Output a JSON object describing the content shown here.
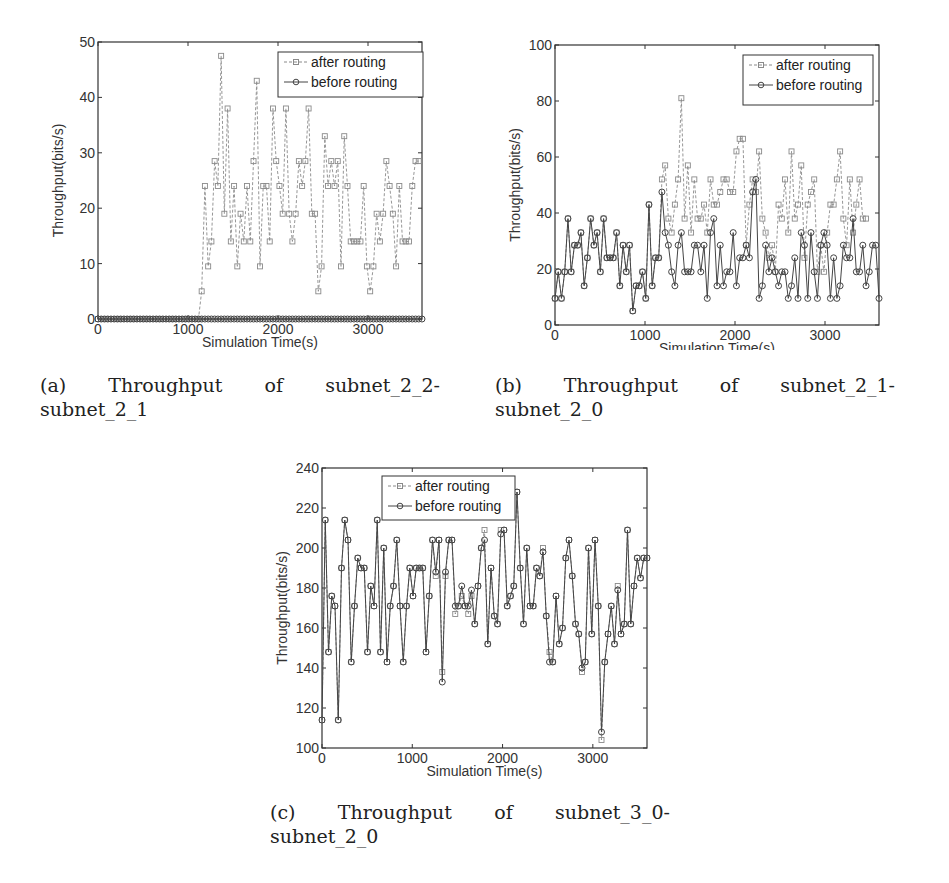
{
  "figures": [
    {
      "id": "a",
      "caption_line1": [
        "(a)",
        "Throughput",
        "of",
        "subnet_2_2-"
      ],
      "caption_line2": "subnet_2_1"
    },
    {
      "id": "b",
      "caption_line1": [
        "(b)",
        "Throughput",
        "of",
        "subnet_2_1-"
      ],
      "caption_line2": "subnet_2_0"
    },
    {
      "id": "c",
      "caption_line1": [
        "(c)",
        "Throughput",
        "of",
        "subnet_3_0-"
      ],
      "caption_line2": "subnet_2_0"
    }
  ],
  "chart_data": [
    {
      "type": "line",
      "title": "",
      "xlabel": "Simulation Time(s)",
      "ylabel": "Throughput(bits/s)",
      "xlim": [
        0,
        3600
      ],
      "ylim": [
        0,
        50
      ],
      "xticks": [
        0,
        1000,
        2000,
        3000
      ],
      "yticks": [
        0,
        10,
        20,
        30,
        40,
        50
      ],
      "grid": false,
      "legend_position": "upper right",
      "legend": [
        "after routing",
        "before routing"
      ],
      "x_step": 36,
      "series": [
        {
          "name": "after routing",
          "marker": "square",
          "values": [
            0,
            0,
            0,
            0,
            0,
            0,
            0,
            0,
            0,
            0,
            0,
            0,
            0,
            0,
            0,
            0,
            0,
            0,
            0,
            0,
            0,
            0,
            0,
            0,
            0,
            0,
            0,
            0,
            0,
            0,
            0,
            0,
            5,
            24,
            9.5,
            14,
            28.5,
            24,
            47.5,
            19,
            38,
            14,
            24,
            9.5,
            19,
            14,
            24,
            14,
            28.5,
            43,
            9.5,
            24,
            24,
            14,
            38,
            28.5,
            24,
            19,
            38,
            19,
            14,
            19,
            28.5,
            24,
            28.5,
            38,
            19,
            19,
            5,
            9.5,
            33,
            24,
            28.5,
            24,
            28.5,
            9.5,
            33,
            24,
            14,
            14,
            14,
            14,
            24,
            9.5,
            5,
            9.5,
            19,
            14,
            19,
            28.5,
            24,
            19,
            9.5,
            24,
            14,
            14,
            14,
            24,
            28.5,
            28.5
          ]
        },
        {
          "name": "before routing",
          "marker": "circle",
          "values": [
            0,
            0,
            0,
            0,
            0,
            0,
            0,
            0,
            0,
            0,
            0,
            0,
            0,
            0,
            0,
            0,
            0,
            0,
            0,
            0,
            0,
            0,
            0,
            0,
            0,
            0,
            0,
            0,
            0,
            0,
            0,
            0,
            0,
            0,
            0,
            0,
            0,
            0,
            0,
            0,
            0,
            0,
            0,
            0,
            0,
            0,
            0,
            0,
            0,
            0,
            0,
            0,
            0,
            0,
            0,
            0,
            0,
            0,
            0,
            0,
            0,
            0,
            0,
            0,
            0,
            0,
            0,
            0,
            0,
            0,
            0,
            0,
            0,
            0,
            0,
            0,
            0,
            0,
            0,
            0,
            0,
            0,
            0,
            0,
            0,
            0,
            0,
            0,
            0,
            0,
            0,
            0,
            0,
            0,
            0,
            0,
            0,
            0,
            0,
            0,
            0
          ]
        }
      ]
    },
    {
      "type": "line",
      "title": "",
      "xlabel": "Simulation Time(s)",
      "ylabel": "Throughput(bits/s)",
      "xlim": [
        0,
        3600
      ],
      "ylim": [
        0,
        100
      ],
      "xticks": [
        0,
        1000,
        2000,
        3000
      ],
      "yticks": [
        0,
        20,
        40,
        60,
        80,
        100
      ],
      "grid": false,
      "legend_position": "upper right",
      "legend": [
        "after  routing",
        "before routing"
      ],
      "x_step": 36,
      "series": [
        {
          "name": "after routing",
          "marker": "square",
          "values": [
            9.5,
            19,
            9.5,
            19,
            38,
            19,
            28.5,
            28.5,
            33,
            14,
            24,
            38,
            28.5,
            33,
            19,
            38,
            24,
            24,
            24,
            33,
            14,
            28.5,
            19,
            28.5,
            5,
            14,
            14,
            19,
            9.5,
            43,
            14,
            24,
            24,
            52,
            57,
            38,
            33,
            43,
            52,
            81,
            38,
            57,
            33,
            52,
            38,
            38,
            43,
            33,
            52,
            43,
            43,
            47.5,
            52,
            52,
            47.5,
            47.5,
            62,
            66.5,
            66.5,
            28.5,
            43,
            52,
            47.5,
            62,
            38,
            33,
            24,
            28.5,
            19,
            43,
            38,
            52,
            33,
            62,
            38,
            43,
            57,
            24,
            43,
            47.5,
            52,
            19,
            28.5,
            19,
            33,
            43,
            43,
            52,
            62,
            38,
            28.5,
            52,
            33,
            43,
            52,
            38,
            38
          ]
        },
        {
          "name": "before routing",
          "marker": "circle",
          "values": [
            9.5,
            19,
            9.5,
            19,
            38,
            19,
            28.5,
            28.5,
            33,
            14,
            24,
            38,
            28.5,
            33,
            19,
            38,
            24,
            24,
            24,
            33,
            14,
            28.5,
            19,
            28.5,
            5,
            14,
            14,
            19,
            9.5,
            43,
            14,
            24,
            24,
            47.5,
            33,
            28.5,
            19,
            14,
            28.5,
            33,
            19,
            19,
            19,
            28.5,
            28.5,
            19,
            28.5,
            9.5,
            33,
            38,
            14,
            28.5,
            14,
            19,
            19,
            33,
            14,
            24,
            24,
            28.5,
            24,
            47.5,
            52,
            9.5,
            14,
            28.5,
            19,
            24,
            19,
            14,
            19,
            19,
            9.5,
            14,
            24,
            9.5,
            33,
            28.5,
            9.5,
            33,
            19,
            9.5,
            28.5,
            33,
            28.5,
            9.5,
            24,
            9.5,
            14,
            28.5,
            24,
            24,
            38,
            19,
            19,
            28.5,
            14,
            19,
            28.5,
            28.5,
            9.5
          ]
        }
      ]
    },
    {
      "type": "line",
      "title": "",
      "xlabel": "Simulation Time(s)",
      "ylabel": "Throughput(bits/s)",
      "xlim": [
        0,
        3600
      ],
      "ylim": [
        100,
        240
      ],
      "xticks": [
        0,
        1000,
        2000,
        3000
      ],
      "yticks": [
        100,
        120,
        140,
        160,
        180,
        200,
        220,
        240
      ],
      "grid": false,
      "legend_position": "upper left-center",
      "legend": [
        "after routing",
        "before routing"
      ],
      "x_step": 36,
      "series": [
        {
          "name": "after routing",
          "marker": "square",
          "values": [
            114,
            214,
            148,
            176,
            171,
            114,
            190,
            214,
            204,
            143,
            171,
            195,
            190,
            190,
            148,
            181,
            171,
            214,
            148,
            200,
            143,
            171,
            181,
            204,
            171,
            143,
            171,
            190,
            176,
            190,
            190,
            190,
            148,
            176,
            204,
            186,
            204,
            138,
            186,
            204,
            204,
            167,
            171,
            176,
            171,
            167,
            176,
            162,
            181,
            200,
            209,
            152,
            190,
            166,
            162,
            209,
            209,
            171,
            176,
            181,
            228,
            190,
            162,
            200,
            171,
            171,
            190,
            186,
            200,
            166,
            148,
            143,
            176,
            152,
            160,
            195,
            204,
            186,
            162,
            157,
            138,
            143,
            200,
            157,
            204,
            171,
            104,
            143,
            157,
            171,
            152,
            181,
            157,
            162,
            209,
            162,
            181,
            195,
            185,
            195,
            195
          ]
        },
        {
          "name": "before routing",
          "marker": "circle",
          "values": [
            114,
            214,
            148,
            176,
            171,
            114,
            190,
            214,
            204,
            143,
            171,
            195,
            190,
            190,
            148,
            181,
            171,
            214,
            148,
            200,
            143,
            171,
            181,
            204,
            171,
            143,
            171,
            190,
            176,
            190,
            190,
            190,
            148,
            176,
            204,
            188,
            204,
            133,
            188,
            204,
            204,
            171,
            171,
            181,
            171,
            171,
            179,
            162,
            181,
            200,
            204,
            152,
            190,
            166,
            162,
            207,
            209,
            171,
            176,
            181,
            228,
            190,
            162,
            200,
            171,
            171,
            190,
            186,
            198,
            166,
            143,
            143,
            176,
            152,
            160,
            195,
            204,
            186,
            162,
            157,
            140,
            143,
            200,
            157,
            204,
            171,
            108,
            143,
            157,
            171,
            152,
            179,
            157,
            162,
            209,
            162,
            181,
            195,
            185,
            195,
            195
          ]
        }
      ]
    }
  ]
}
